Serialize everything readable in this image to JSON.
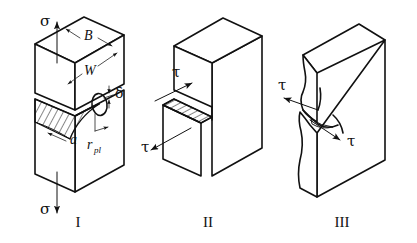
{
  "figure": {
    "background_color": "#ffffff",
    "line_color": "#111111",
    "width": 417,
    "height": 243
  },
  "modes": [
    {
      "id": "mode-1",
      "roman_label": "I",
      "name": "opening-mode",
      "load_symbol_top": "σ",
      "load_symbol_bottom": "σ",
      "dimension_labels": [
        {
          "key": "thickness",
          "text": "B"
        },
        {
          "key": "width",
          "text": "W"
        },
        {
          "key": "crack-tip-opening-displacement",
          "text": "δ"
        },
        {
          "key": "crack-length",
          "text": "a"
        },
        {
          "key": "plastic-zone-radius",
          "text": "r",
          "subscript": "pl"
        }
      ]
    },
    {
      "id": "mode-2",
      "roman_label": "II",
      "name": "in-plane-shear-mode",
      "load_symbol_top": "τ",
      "load_symbol_bottom": "τ"
    },
    {
      "id": "mode-3",
      "roman_label": "III",
      "name": "out-of-plane-shear-mode",
      "load_symbol_top": "τ",
      "load_symbol_bottom": "τ"
    }
  ]
}
